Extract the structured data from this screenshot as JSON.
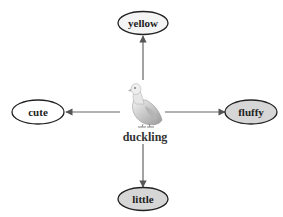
{
  "diagram": {
    "center": {
      "label": "duckling",
      "icon": "duckling-image"
    },
    "nodes": [
      {
        "id": "yellow",
        "label": "yellow",
        "position": "top",
        "fill": "#f4f4f4"
      },
      {
        "id": "cute",
        "label": "cute",
        "position": "left",
        "fill": "#ffffff"
      },
      {
        "id": "fluffy",
        "label": "fluffy",
        "position": "right",
        "fill": "#d6d6d6"
      },
      {
        "id": "little",
        "label": "little",
        "position": "bottom",
        "fill": "#d6d6d6"
      }
    ],
    "edges": [
      {
        "from": "duckling",
        "to": "yellow"
      },
      {
        "from": "duckling",
        "to": "cute"
      },
      {
        "from": "duckling",
        "to": "fluffy"
      },
      {
        "from": "duckling",
        "to": "little"
      }
    ],
    "colors": {
      "edge": "#666666",
      "stroke": "#222222"
    }
  }
}
